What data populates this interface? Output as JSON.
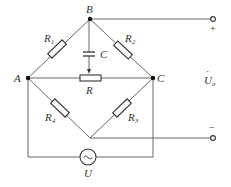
{
  "diagram": {
    "type": "bridge-circuit",
    "nodes": {
      "A": {
        "label": "A"
      },
      "B": {
        "label": "B"
      },
      "C": {
        "label": "C"
      }
    },
    "components": {
      "R1": {
        "label": "R",
        "sub": "1"
      },
      "R2": {
        "label": "R",
        "sub": "2"
      },
      "R3": {
        "label": "R",
        "sub": "3"
      },
      "R4": {
        "label": "R",
        "sub": "4"
      },
      "R": {
        "label": "R"
      },
      "C": {
        "label": "C"
      },
      "U": {
        "label": "U",
        "symbol": "~"
      }
    },
    "output": {
      "label": "U",
      "dot": "·",
      "sub": "o",
      "plus": "+",
      "minus": "−"
    },
    "colors": {
      "wire": "#555555",
      "component": "#333333",
      "node": "#111111",
      "background": "#ffffff"
    }
  }
}
